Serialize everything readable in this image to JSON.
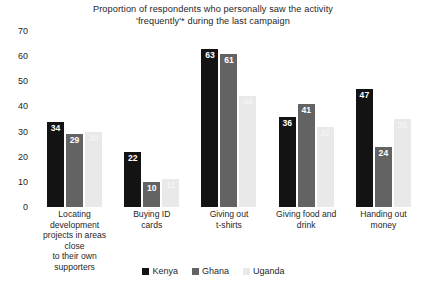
{
  "chart_data": {
    "type": "bar",
    "title": "Proportion of respondents who personally saw the activity 'frequently'* during the last campaign",
    "title_line1": "Proportion of respondents who personally saw the activity",
    "title_line2": "'frequently'* during the last campaign",
    "xlabel": "",
    "ylabel": "",
    "ylim": [
      0,
      70
    ],
    "ytick_step": 10,
    "yticks": [
      "70",
      "60",
      "50",
      "40",
      "30",
      "20",
      "10",
      "0"
    ],
    "grid": false,
    "legend_position": "bottom-center",
    "categories": [
      "Locating development projects in areas close to their own supporters",
      "Buying ID cards",
      "Giving out t-shirts",
      "Giving food and drink",
      "Handing out money"
    ],
    "category_lines": [
      [
        "Locating development",
        "projects in areas close",
        "to their own",
        "supporters"
      ],
      [
        "Buying ID",
        "cards"
      ],
      [
        "Giving out",
        "t-shirts"
      ],
      [
        "Giving food and",
        "drink"
      ],
      [
        "Handing out",
        "money"
      ]
    ],
    "series": [
      {
        "name": "Kenya",
        "color": "#131313",
        "values": [
          34,
          22,
          63,
          36,
          47
        ]
      },
      {
        "name": "Ghana",
        "color": "#636363",
        "values": [
          29,
          10,
          61,
          41,
          24
        ]
      },
      {
        "name": "Uganda",
        "color": "#e9e9e9",
        "values": [
          30,
          11,
          44,
          32,
          35
        ]
      }
    ]
  }
}
